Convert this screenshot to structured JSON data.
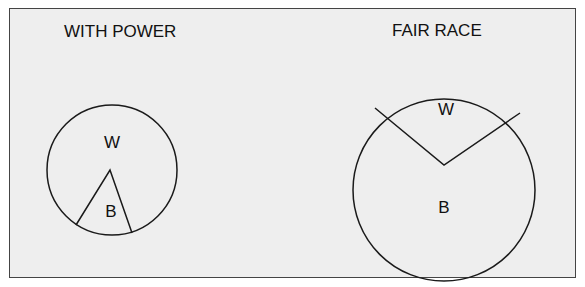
{
  "colors": {
    "background": "#eeeeee",
    "border": "#444444",
    "stroke": "#1a1a1a",
    "text": "#111111"
  },
  "panels": [
    {
      "title": "WITH POWER",
      "circle": {
        "cx": 112,
        "cy": 170,
        "r": 65
      },
      "wedge": {
        "apex": [
          110,
          170
        ],
        "p1": [
          76,
          225
        ],
        "p2": [
          132,
          233
        ]
      },
      "labels": {
        "outer": "W",
        "wedge": "B"
      }
    },
    {
      "title": "FAIR RACE",
      "circle": {
        "cx": 444,
        "cy": 190,
        "r": 91
      },
      "wedge": {
        "apex": [
          444,
          165
        ],
        "p1": [
          375,
          108
        ],
        "p2": [
          520,
          113
        ]
      },
      "labels": {
        "wedge": "W",
        "outer": "B"
      }
    }
  ]
}
